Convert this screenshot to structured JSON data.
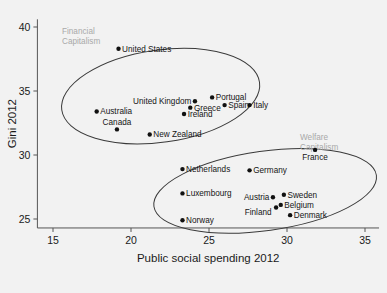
{
  "chart_data": {
    "type": "scatter",
    "title": "",
    "xlabel": "Public social spending 2012",
    "ylabel": "Gini 2012",
    "xlim": [
      13.5,
      36.5
    ],
    "ylim": [
      23.6,
      40.8
    ],
    "xticks": [
      15,
      20,
      25,
      30,
      35
    ],
    "yticks": [
      25,
      30,
      35,
      40
    ],
    "grid": false,
    "legend": "none",
    "points": [
      {
        "label": "United States",
        "x": 19.2,
        "y": 38.3,
        "label_side": "right"
      },
      {
        "label": "United Kingdom",
        "x": 24.1,
        "y": 34.2,
        "label_side": "left"
      },
      {
        "label": "Portugal",
        "x": 25.2,
        "y": 34.5,
        "label_side": "right"
      },
      {
        "label": "Spain",
        "x": 26.0,
        "y": 33.9,
        "label_side": "right"
      },
      {
        "label": "Italy",
        "x": 27.6,
        "y": 33.9,
        "label_side": "right"
      },
      {
        "label": "Greece",
        "x": 23.8,
        "y": 33.7,
        "label_side": "right"
      },
      {
        "label": "Ireland",
        "x": 23.4,
        "y": 33.2,
        "label_side": "right"
      },
      {
        "label": "Australia",
        "x": 17.8,
        "y": 33.4,
        "label_side": "right"
      },
      {
        "label": "Canada",
        "x": 19.1,
        "y": 32.0,
        "label_side": "above"
      },
      {
        "label": "New Zealand",
        "x": 21.2,
        "y": 31.6,
        "label_side": "right"
      },
      {
        "label": "France",
        "x": 31.8,
        "y": 30.4,
        "label_side": "below"
      },
      {
        "label": "Netherlands",
        "x": 23.3,
        "y": 28.9,
        "label_side": "right"
      },
      {
        "label": "Germany",
        "x": 27.6,
        "y": 28.8,
        "label_side": "right"
      },
      {
        "label": "Luxembourg",
        "x": 23.3,
        "y": 27.0,
        "label_side": "right"
      },
      {
        "label": "Austria",
        "x": 29.1,
        "y": 26.7,
        "label_side": "left"
      },
      {
        "label": "Sweden",
        "x": 29.8,
        "y": 26.9,
        "label_side": "right"
      },
      {
        "label": "Belgium",
        "x": 29.6,
        "y": 26.1,
        "label_side": "right"
      },
      {
        "label": "Finland",
        "x": 29.3,
        "y": 25.9,
        "label_side": "left-below"
      },
      {
        "label": "Denmark",
        "x": 30.2,
        "y": 25.3,
        "label_side": "right"
      },
      {
        "label": "Norway",
        "x": 23.3,
        "y": 24.9,
        "label_side": "right"
      }
    ],
    "annotations": [
      {
        "text": "Financial Capitalism",
        "line1": "Financial",
        "line2": "Capitalism",
        "color": "#a9a9a9"
      },
      {
        "text": "Welfare Capitalism",
        "line1": "Welfare",
        "line2": "Capitalism",
        "color": "#a9a9a9"
      }
    ],
    "groupings": [
      {
        "name": "financial-capitalism-ellipse",
        "cx": 21.9,
        "cy": 34.6,
        "rx": 6.4,
        "ry": 3.6,
        "rotation": -8
      },
      {
        "name": "welfare-capitalism-ellipse",
        "cx": 28.6,
        "cy": 27.2,
        "rx": 7.2,
        "ry": 3.1,
        "rotation": -8
      }
    ]
  },
  "axes": {
    "x_title": "Public social spending 2012",
    "y_title": "Gini 2012",
    "x_tick_labels": [
      "15",
      "20",
      "25",
      "30",
      "35"
    ],
    "y_tick_labels": [
      "25",
      "30",
      "35",
      "40"
    ]
  },
  "colors": {
    "background": "#f2f2f2",
    "point": "#111111",
    "axis": "#555555",
    "ellipse": "#3a3a3a",
    "annotation": "#a9a9a9"
  }
}
